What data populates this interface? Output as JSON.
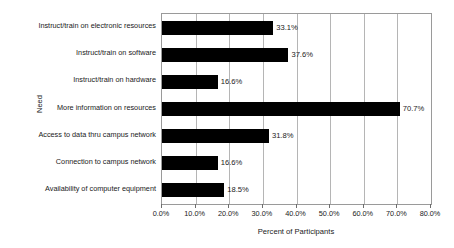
{
  "chart_data": {
    "type": "bar",
    "orientation": "horizontal",
    "title": "",
    "xlabel": "Percent of Participants",
    "ylabel": "Need",
    "xlim": [
      0,
      80
    ],
    "xtick_labels": [
      "0.0%",
      "10.0%",
      "20.0%",
      "30.0%",
      "40.0%",
      "50.0%",
      "60.0%",
      "70.0%",
      "80.0%"
    ],
    "xtick_values": [
      0,
      10,
      20,
      30,
      40,
      50,
      60,
      70,
      80
    ],
    "grid": true,
    "grid_axis": "x",
    "legend": false,
    "bar_color": "#000000",
    "categories": [
      "Instruct/train on electronic resources",
      "Instruct/train on software",
      "Instruct/train on hardware",
      "More information on resources",
      "Access to data thru campus network",
      "Connection to campus network",
      "Availability of computer equipment"
    ],
    "values": [
      33.1,
      37.6,
      16.6,
      70.7,
      31.8,
      16.6,
      18.5
    ],
    "data_labels": [
      "33.1%",
      "37.6%",
      "16.6%",
      "70.7%",
      "31.8%",
      "16.6%",
      "18.5%"
    ]
  }
}
